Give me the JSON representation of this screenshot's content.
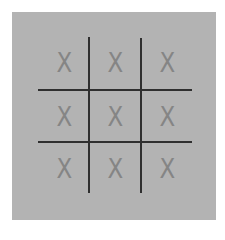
{
  "game": {
    "name": "tic-tac-toe",
    "colors": {
      "board_background": "#b3b3b3",
      "grid_line": "#2f2f2f",
      "mark": "#858585"
    },
    "board": [
      [
        "X",
        "X",
        "X"
      ],
      [
        "X",
        "X",
        "X"
      ],
      [
        "X",
        "X",
        "X"
      ]
    ],
    "cells": {
      "r0c0": "X",
      "r0c1": "X",
      "r0c2": "X",
      "r1c0": "X",
      "r1c1": "X",
      "r1c2": "X",
      "r2c0": "X",
      "r2c1": "X",
      "r2c2": "X"
    }
  }
}
